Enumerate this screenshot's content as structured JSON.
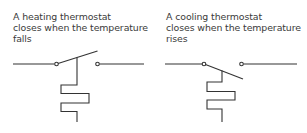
{
  "diagrams": [
    {
      "id": "heating",
      "caption_lines": [
        "A heating thermostat",
        "closes when the temperature",
        "falls"
      ],
      "switch_state": "arm raised (open)"
    },
    {
      "id": "cooling",
      "caption_lines": [
        "A cooling thermostat",
        "closes when the temperature",
        "rises"
      ],
      "switch_state": "arm lowered (open)"
    }
  ],
  "colors": {
    "line": "#333333",
    "text": "#3a3a3a",
    "background": "#ffffff"
  }
}
